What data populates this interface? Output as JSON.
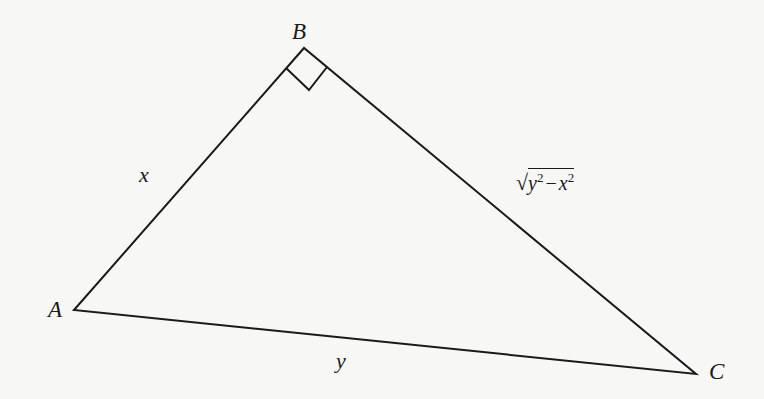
{
  "diagram": {
    "type": "right-triangle",
    "vertices": {
      "A": {
        "label": "A",
        "x": 74,
        "y": 310
      },
      "B": {
        "label": "B",
        "x": 304,
        "y": 48
      },
      "C": {
        "label": "C",
        "x": 696,
        "y": 374
      }
    },
    "right_angle_at": "B",
    "sides": {
      "AB": {
        "label": "x"
      },
      "AC": {
        "label": "y"
      },
      "BC": {
        "label_radical": "√",
        "label_base1": "y",
        "label_exp1": "2",
        "label_minus": "−",
        "label_base2": "x",
        "label_exp2": "2",
        "label_text": "√(y² − x²)"
      }
    },
    "colors": {
      "line": "#1a1a1a",
      "background": "#f7f7f5"
    }
  }
}
